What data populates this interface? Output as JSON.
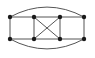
{
  "figure": {
    "type": "graph-drawing",
    "background_color": "#ffffff",
    "vertex_color": "#1a1a1a",
    "edge_color": "#555555",
    "vertex_radius": 2.2,
    "edge_width": 1,
    "width": 95,
    "height": 58
  },
  "graph": {
    "vertex_count": 8,
    "edge_count": 12,
    "vertices": [
      {
        "id": "v1",
        "label": "",
        "x": 10,
        "y": 17,
        "position": "top-left"
      },
      {
        "id": "v2",
        "label": "",
        "x": 34,
        "y": 17,
        "position": "top-center-left"
      },
      {
        "id": "v3",
        "label": "",
        "x": 60,
        "y": 17,
        "position": "top-center-right"
      },
      {
        "id": "v4",
        "label": "",
        "x": 84,
        "y": 17,
        "position": "top-right"
      },
      {
        "id": "v5",
        "label": "",
        "x": 10,
        "y": 39,
        "position": "bottom-left"
      },
      {
        "id": "v6",
        "label": "",
        "x": 34,
        "y": 39,
        "position": "bottom-center-left"
      },
      {
        "id": "v7",
        "label": "",
        "x": 60,
        "y": 39,
        "position": "bottom-center-right"
      },
      {
        "id": "v8",
        "label": "",
        "x": 84,
        "y": 39,
        "position": "bottom-right"
      }
    ],
    "edges": [
      {
        "id": "e1",
        "from": "v1",
        "to": "v2",
        "kind": "straight",
        "d": "M 10 17 L 34 17"
      },
      {
        "id": "e2",
        "from": "v2",
        "to": "v3",
        "kind": "straight",
        "d": "M 34 17 L 60 17"
      },
      {
        "id": "e3",
        "from": "v3",
        "to": "v4",
        "kind": "straight",
        "d": "M 60 17 L 84 17"
      },
      {
        "id": "e4",
        "from": "v5",
        "to": "v6",
        "kind": "straight",
        "d": "M 10 39 L 34 39"
      },
      {
        "id": "e5",
        "from": "v6",
        "to": "v7",
        "kind": "straight",
        "d": "M 34 39 L 60 39"
      },
      {
        "id": "e6",
        "from": "v7",
        "to": "v8",
        "kind": "straight",
        "d": "M 60 39 L 84 39"
      },
      {
        "id": "e7",
        "from": "v1",
        "to": "v5",
        "kind": "straight",
        "d": "M 10 17 L 10 39"
      },
      {
        "id": "e8",
        "from": "v2",
        "to": "v6",
        "kind": "straight",
        "d": "M 34 17 L 34 39"
      },
      {
        "id": "e9",
        "from": "v3",
        "to": "v7",
        "kind": "straight",
        "d": "M 60 17 L 60 39"
      },
      {
        "id": "e10",
        "from": "v4",
        "to": "v8",
        "kind": "straight",
        "d": "M 84 17 L 84 39"
      },
      {
        "id": "e11",
        "from": "v2",
        "to": "v7",
        "kind": "diagonal",
        "d": "M 34 17 L 60 39"
      },
      {
        "id": "e12",
        "from": "v3",
        "to": "v6",
        "kind": "diagonal",
        "d": "M 60 17 L 34 39"
      },
      {
        "id": "e13",
        "from": "v1",
        "to": "v4",
        "kind": "arc-top",
        "d": "M 10 17 Q 47 -3 84 17"
      },
      {
        "id": "e14",
        "from": "v5",
        "to": "v8",
        "kind": "arc-bottom",
        "d": "M 10 39 Q 47 59 84 39"
      }
    ]
  }
}
